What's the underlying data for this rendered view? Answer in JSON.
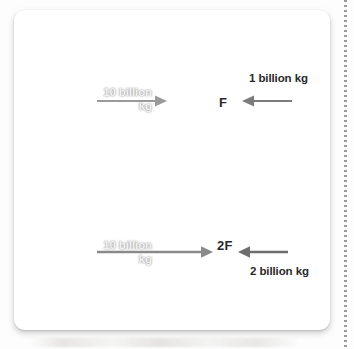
{
  "figure": {
    "type": "physics-force-diagram",
    "colors": {
      "card_background": "#ffffff",
      "page_background": "#fdfdfd",
      "sphere_dark": "#2b2b2b",
      "arrow_gray": "#8a8a8a",
      "arrow_gray_dark": "#6e6e6e",
      "label_light": "#f2f2f2",
      "label_dark": "#2a2a2a",
      "separator": "#9a9a9a"
    },
    "rows": [
      {
        "id": "top-row",
        "large_mass_label": "10 billion\nkg",
        "force_label": "F",
        "small_mass_label": "1 billion kg",
        "arrow_from_large": "right",
        "arrow_from_small": "left"
      },
      {
        "id": "bottom-row",
        "large_mass_label": "10 billion\nkg",
        "force_label": "2F",
        "small_mass_label": "2 billion kg",
        "arrow_from_large": "right",
        "arrow_from_small": "left"
      }
    ]
  }
}
